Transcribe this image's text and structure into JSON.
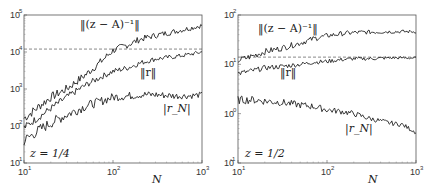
{
  "chart_data": [
    {
      "type": "line",
      "panel": "left",
      "annotation": "z = 1/4",
      "xlabel": "N",
      "ylabel": "",
      "xscale": "log",
      "yscale": "log",
      "xlim": [
        10,
        1000
      ],
      "ylim": [
        10,
        100000
      ],
      "x_ticks": [
        "10^1",
        "10^2",
        "10^3"
      ],
      "y_ticks": [
        "10^1",
        "10^2",
        "10^3",
        "10^4",
        "10^5"
      ],
      "reference_line": {
        "style": "dashed",
        "y": 12000
      },
      "x": [
        10,
        15,
        20,
        30,
        50,
        70,
        100,
        150,
        200,
        300,
        500,
        700,
        1000
      ],
      "series": [
        {
          "name": "||(z − A)^{-1}||",
          "values": [
            160,
            350,
            600,
            1000,
            2500,
            5000,
            11000,
            16000,
            22000,
            28000,
            36000,
            43000,
            52000
          ]
        },
        {
          "name": "||r||",
          "values": [
            90,
            180,
            300,
            600,
            1300,
            2000,
            3000,
            3800,
            5000,
            6500,
            7500,
            8500,
            10000
          ]
        },
        {
          "name": "|r_N|",
          "values": [
            40,
            80,
            120,
            200,
            350,
            450,
            600,
            650,
            700,
            700,
            650,
            650,
            700
          ]
        }
      ],
      "grid": false,
      "legend": "inline labels"
    },
    {
      "type": "line",
      "panel": "right",
      "annotation": "z = 1/2",
      "xlabel": "N",
      "ylabel": "",
      "xscale": "log",
      "yscale": "log",
      "xlim": [
        10,
        1000
      ],
      "ylim": [
        0.1,
        100
      ],
      "x_ticks": [
        "10^1",
        "10^2",
        "10^3"
      ],
      "y_ticks": [
        "10^-1",
        "10^0",
        "10^1",
        "10^2"
      ],
      "reference_line": {
        "style": "dashed",
        "y": 14
      },
      "x": [
        10,
        15,
        20,
        30,
        50,
        70,
        100,
        150,
        200,
        300,
        500,
        700,
        1000
      ],
      "series": [
        {
          "name": "||(z − A)^{-1}||",
          "values": [
            12,
            15,
            18,
            21,
            27,
            33,
            38,
            42,
            44,
            45,
            46,
            46,
            46
          ]
        },
        {
          "name": "||r||",
          "values": [
            6.5,
            7.5,
            8.5,
            9,
            10,
            11,
            11.5,
            12.5,
            13,
            13,
            13.5,
            13.5,
            13.5
          ]
        },
        {
          "name": "|r_N|",
          "values": [
            1.9,
            1.9,
            1.8,
            1.7,
            1.5,
            1.4,
            1.2,
            1.1,
            1.0,
            0.8,
            0.65,
            0.6,
            0.42
          ]
        }
      ],
      "grid": false,
      "legend": "inline labels"
    }
  ],
  "left": {
    "annotation": "z = 1/4",
    "xlabel": "N",
    "labels": {
      "resolvent": "‖(z − A)⁻¹‖",
      "r_norm": "‖r‖",
      "rN": "|r_N|"
    },
    "xticks": [
      {
        "base": "10",
        "exp": "1"
      },
      {
        "base": "10",
        "exp": "2"
      },
      {
        "base": "10",
        "exp": "3"
      }
    ],
    "yticks": [
      {
        "base": "10",
        "exp": "1"
      },
      {
        "base": "10",
        "exp": "2"
      },
      {
        "base": "10",
        "exp": "3"
      },
      {
        "base": "10",
        "exp": "4"
      },
      {
        "base": "10",
        "exp": "5"
      }
    ]
  },
  "right": {
    "annotation": "z = 1/2",
    "xlabel": "N",
    "labels": {
      "resolvent": "‖(z − A)⁻¹‖",
      "r_norm": "‖r‖",
      "rN": "|r_N|"
    },
    "xticks": [
      {
        "base": "10",
        "exp": "1"
      },
      {
        "base": "10",
        "exp": "2"
      },
      {
        "base": "10",
        "exp": "3"
      }
    ],
    "yticks": [
      {
        "base": "10",
        "exp": "-1"
      },
      {
        "base": "10",
        "exp": "0"
      },
      {
        "base": "10",
        "exp": "1"
      },
      {
        "base": "10",
        "exp": "2"
      }
    ]
  }
}
